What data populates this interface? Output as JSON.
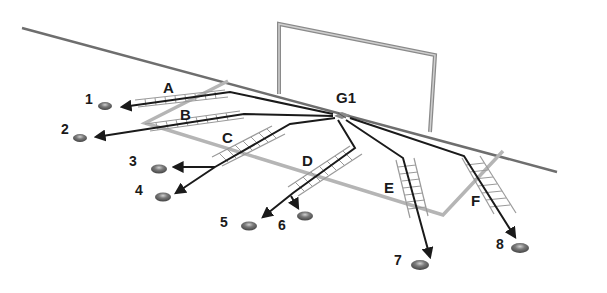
{
  "diagram": {
    "title": "",
    "start_label": "G1",
    "ladders": [
      {
        "id": "A",
        "label": "A"
      },
      {
        "id": "B",
        "label": "B"
      },
      {
        "id": "C",
        "label": "C"
      },
      {
        "id": "D",
        "label": "D"
      },
      {
        "id": "E",
        "label": "E"
      },
      {
        "id": "F",
        "label": "F"
      }
    ],
    "cones": [
      {
        "id": "1",
        "label": "1"
      },
      {
        "id": "2",
        "label": "2"
      },
      {
        "id": "3",
        "label": "3"
      },
      {
        "id": "4",
        "label": "4"
      },
      {
        "id": "5",
        "label": "5"
      },
      {
        "id": "6",
        "label": "6"
      },
      {
        "id": "7",
        "label": "7"
      },
      {
        "id": "8",
        "label": "8"
      }
    ],
    "colors": {
      "field_line": "#6e6e6e",
      "penalty_box": "#b5b5b5",
      "goal_frame": "#8a8a8a",
      "path": "#1a1a1a",
      "ladder": "#9a9a9a",
      "cone": "#6b6b6b"
    }
  }
}
